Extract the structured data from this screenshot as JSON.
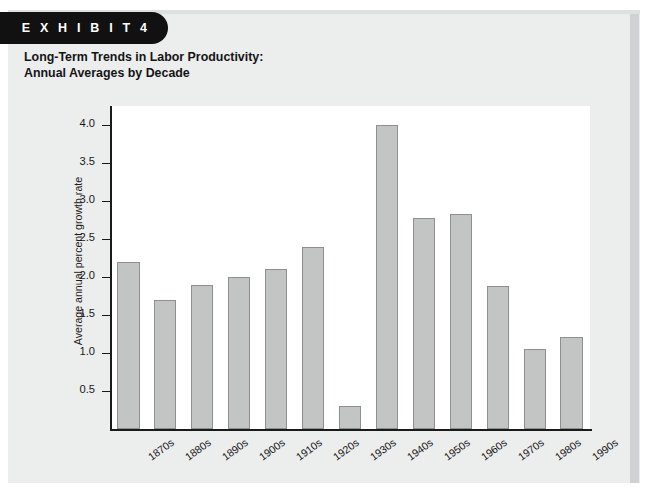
{
  "banner": {
    "label": "E X H I B I T   4"
  },
  "title": {
    "line1": "Long-Term Trends in Labor Productivity:",
    "line2": "Annual Averages by Decade"
  },
  "colors": {
    "banner_bg": "#111111",
    "card_bg": "#eceded",
    "plot_bg": "#ffffff",
    "bar_fill": "#c3c4c4",
    "bar_border": "#8e9090",
    "axis": "#1a1a1a"
  },
  "chart_data": {
    "type": "bar",
    "title": "Long-Term Trends in Labor Productivity: Annual Averages by Decade",
    "xlabel": "",
    "ylabel": "Average annual percent growth rate",
    "categories": [
      "1870s",
      "1880s",
      "1890s",
      "1900s",
      "1910s",
      "1920s",
      "1930s",
      "1940s",
      "1950s",
      "1960s",
      "1970s",
      "1980s",
      "1990s"
    ],
    "values": [
      2.2,
      1.7,
      1.9,
      2.0,
      2.1,
      2.4,
      0.3,
      4.0,
      2.77,
      2.83,
      1.88,
      1.05,
      1.21
    ],
    "ylim": [
      0,
      4.25
    ],
    "yticks": [
      0.5,
      1.0,
      1.5,
      2.0,
      2.5,
      3.0,
      3.5,
      4.0
    ],
    "ytick_labels": [
      "0.5",
      "1.0",
      "1.5",
      "2.0",
      "2.5",
      "3.0",
      "3.5",
      "4.0"
    ],
    "grid": false,
    "legend": null
  }
}
